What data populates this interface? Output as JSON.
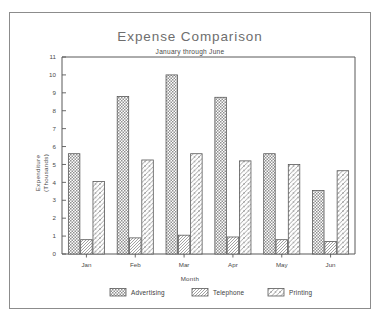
{
  "window": {
    "background_color": "#ffffff",
    "frame_color": "#8c8c8c"
  },
  "chart_data": {
    "type": "bar",
    "title": "Expense Comparison",
    "subtitle": "January through June",
    "xlabel": "Month",
    "ylabel_line1": "Expenditure",
    "ylabel_line2": "(Thousands)",
    "categories": [
      "Jan",
      "Feb",
      "Mar",
      "Apr",
      "May",
      "Jun"
    ],
    "series": [
      {
        "name": "Advertising",
        "pattern": "checkerboard",
        "values": [
          5.6,
          8.8,
          10.0,
          8.75,
          5.6,
          3.55
        ]
      },
      {
        "name": "Telephone",
        "pattern": "diagonal-dense",
        "values": [
          0.8,
          0.9,
          1.05,
          0.95,
          0.8,
          0.7
        ]
      },
      {
        "name": "Printing",
        "pattern": "diagonal-wide",
        "values": [
          4.05,
          5.25,
          5.6,
          5.2,
          5.0,
          4.65
        ]
      }
    ],
    "ylim": [
      0,
      11
    ],
    "ytick_labels": [
      "0",
      "1",
      "2",
      "3",
      "4",
      "5",
      "6",
      "7",
      "8",
      "9",
      "10",
      "11"
    ],
    "ytick_values": [
      0,
      1,
      2,
      3,
      4,
      5,
      6,
      7,
      8,
      9,
      10,
      11
    ],
    "grid": false,
    "legend_position": "bottom",
    "legend_entries": [
      "Advertising",
      "Telephone",
      "Printing"
    ],
    "axis_color": "#595959",
    "bar_outline_color": "#5a5a5a"
  }
}
